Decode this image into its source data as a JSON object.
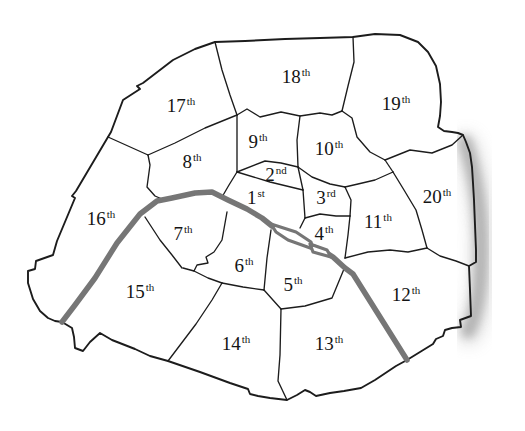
{
  "map": {
    "districts": [
      {
        "number": "1",
        "suffix": "st",
        "x": 256,
        "y": 204
      },
      {
        "number": "2",
        "suffix": "nd",
        "x": 276,
        "y": 181
      },
      {
        "number": "3",
        "suffix": "rd",
        "x": 326,
        "y": 204
      },
      {
        "number": "4",
        "suffix": "th",
        "x": 324,
        "y": 240
      },
      {
        "number": "5",
        "suffix": "th",
        "x": 293,
        "y": 291
      },
      {
        "number": "6",
        "suffix": "th",
        "x": 244,
        "y": 272
      },
      {
        "number": "7",
        "suffix": "th",
        "x": 183,
        "y": 240
      },
      {
        "number": "8",
        "suffix": "th",
        "x": 192,
        "y": 168
      },
      {
        "number": "9",
        "suffix": "th",
        "x": 258,
        "y": 148
      },
      {
        "number": "10",
        "suffix": "th",
        "x": 329,
        "y": 155
      },
      {
        "number": "11",
        "suffix": "th",
        "x": 378,
        "y": 228
      },
      {
        "number": "12",
        "suffix": "th",
        "x": 406,
        "y": 301
      },
      {
        "number": "13",
        "suffix": "th",
        "x": 329,
        "y": 350
      },
      {
        "number": "14",
        "suffix": "th",
        "x": 236,
        "y": 350
      },
      {
        "number": "15",
        "suffix": "th",
        "x": 140,
        "y": 298
      },
      {
        "number": "16",
        "suffix": "th",
        "x": 101,
        "y": 225
      },
      {
        "number": "17",
        "suffix": "th",
        "x": 181,
        "y": 112
      },
      {
        "number": "18",
        "suffix": "th",
        "x": 296,
        "y": 83
      },
      {
        "number": "19",
        "suffix": "th",
        "x": 396,
        "y": 110
      },
      {
        "number": "20",
        "suffix": "th",
        "x": 437,
        "y": 203
      }
    ],
    "colors": {
      "line": "#1c1c1c",
      "river": "#767676",
      "shadow": "#9b9b9b",
      "background": "#ffffff"
    }
  }
}
